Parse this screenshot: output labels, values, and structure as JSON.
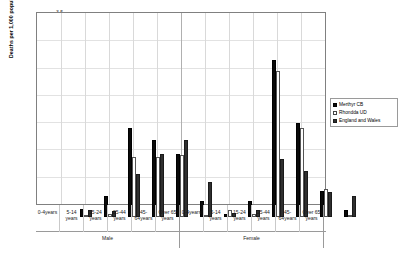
{
  "chart_data": {
    "type": "bar",
    "title": "",
    "subtitle": "",
    "xlabel": "",
    "ylabel": "Deaths per 1,000 population",
    "ylim": [
      0,
      3.5
    ],
    "ytick_step": 0.5,
    "yticks": [
      "0",
      "0.5",
      "1",
      "1.5",
      "2",
      "2.5",
      "3",
      "3.5"
    ],
    "grid": true,
    "legend_position": "right",
    "group_labels": [
      "Male",
      "Female"
    ],
    "categories": [
      "0-4years",
      "5-14 years",
      "15-24 years",
      "25-44 years",
      "45-64years",
      "Over 65 years"
    ],
    "category_lines": [
      [
        "0-4years"
      ],
      [
        "5-14",
        "years"
      ],
      [
        "15-24",
        "years"
      ],
      [
        "25-44",
        "years"
      ],
      [
        "45-",
        "64years"
      ],
      [
        "Over 65",
        "years"
      ]
    ],
    "series": [
      {
        "name": "Merthyr CB",
        "color": "#0a0a0a",
        "values_male": [
          0.14,
          0.38,
          1.63,
          1.42,
          1.16,
          0.3
        ],
        "values_female": [
          0.05,
          0.29,
          2.87,
          1.73,
          0.47,
          0.12
        ]
      },
      {
        "name": "Rhondda UD",
        "color": "#ffffff",
        "values_male": [
          0.02,
          0.06,
          1.1,
          1.1,
          1.13,
          0.01
        ],
        "values_female": [
          0.13,
          0.06,
          2.67,
          1.63,
          0.52,
          0.02
        ]
      },
      {
        "name": "England and Wales",
        "color": "#2f2f2f",
        "values_male": [
          0.12,
          0.11,
          0.78,
          1.15,
          1.41,
          0.65
        ],
        "values_female": [
          0.07,
          0.12,
          1.06,
          0.85,
          0.46,
          0.38
        ]
      }
    ]
  },
  "legend": {
    "items": [
      {
        "label": "Merthyr CB"
      },
      {
        "label": "Rhondda UD"
      },
      {
        "label": "England and Wales"
      }
    ]
  }
}
